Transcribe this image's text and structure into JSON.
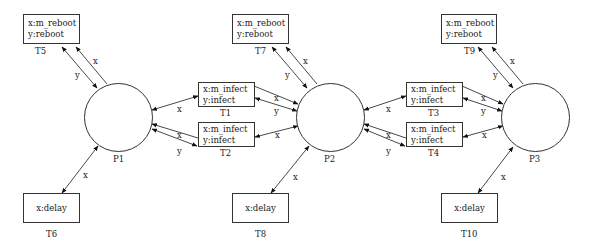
{
  "diagram": {
    "type": "petri-net",
    "places": [
      {
        "id": "P1",
        "label": "P1"
      },
      {
        "id": "P2",
        "label": "P2"
      },
      {
        "id": "P3",
        "label": "P3"
      }
    ],
    "transitions": [
      {
        "id": "T1",
        "label": "T1",
        "lines": [
          "x:m_infect",
          "y:infect"
        ]
      },
      {
        "id": "T2",
        "label": "T2",
        "lines": [
          "x:m_infect",
          "y:infect"
        ]
      },
      {
        "id": "T3",
        "label": "T3",
        "lines": [
          "x:m_infect",
          "y:infect"
        ]
      },
      {
        "id": "T4",
        "label": "T4",
        "lines": [
          "x:m_infect",
          "y:infect"
        ]
      },
      {
        "id": "T5",
        "label": "T5",
        "lines": [
          "x:m_reboot",
          "y:reboot"
        ]
      },
      {
        "id": "T6",
        "label": "T6",
        "lines": [
          "x:delay"
        ]
      },
      {
        "id": "T7",
        "label": "T7",
        "lines": [
          "x:m_reboot",
          "y:reboot"
        ]
      },
      {
        "id": "T8",
        "label": "T8",
        "lines": [
          "x:delay"
        ]
      },
      {
        "id": "T9",
        "label": "T9",
        "lines": [
          "x:m_reboot",
          "y:reboot"
        ]
      },
      {
        "id": "T10",
        "label": "T10",
        "lines": [
          "x:delay"
        ]
      }
    ],
    "arc_labels": {
      "x": "x",
      "y": "y"
    }
  }
}
